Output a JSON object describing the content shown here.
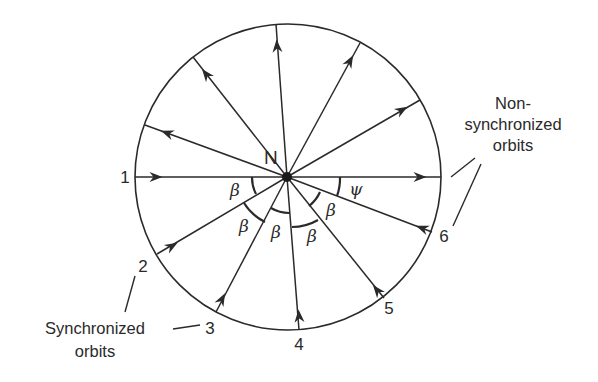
{
  "diagram": {
    "center_label": "N",
    "circle": {
      "cx": 288,
      "cy": 177,
      "r": 153
    },
    "colors": {
      "stroke": "#2a2a2a",
      "text": "#2a2a2a",
      "background": "#ffffff"
    },
    "incoming_orbits": [
      {
        "id": "1",
        "label": "1",
        "start": [
          135,
          177
        ],
        "arrow": [
          156,
          177
        ],
        "label_pos": [
          125,
          183
        ]
      },
      {
        "id": "2",
        "label": "2",
        "start": [
          157,
          254
        ],
        "arrow": [
          172,
          246
        ],
        "label_pos": [
          143,
          272
        ]
      },
      {
        "id": "3",
        "label": "3",
        "start": [
          216,
          312
        ],
        "arrow": [
          222,
          299
        ],
        "label_pos": [
          210,
          334
        ]
      },
      {
        "id": "4",
        "label": "4",
        "start": [
          299,
          330
        ],
        "arrow": [
          299,
          316
        ],
        "label_pos": [
          299,
          350
        ]
      },
      {
        "id": "5",
        "label": "5",
        "start": [
          384,
          298
        ],
        "arrow": [
          377,
          290
        ],
        "label_pos": [
          389,
          314
        ]
      },
      {
        "id": "6",
        "label": "6",
        "start": [
          432,
          232
        ],
        "arrow": [
          422,
          228
        ],
        "label_pos": [
          444,
          242
        ]
      }
    ],
    "outgoing_rays": [
      {
        "end": [
          441,
          177
        ],
        "arrow": [
          420,
          177
        ]
      },
      {
        "end": [
          420,
          100
        ],
        "arrow": [
          402,
          110
        ]
      },
      {
        "end": [
          360,
          43
        ],
        "arrow": [
          350,
          61
        ]
      },
      {
        "end": [
          276,
          24
        ],
        "arrow": [
          277,
          46
        ]
      },
      {
        "end": [
          193,
          57
        ],
        "arrow": [
          206,
          74
        ]
      },
      {
        "end": [
          145,
          125
        ],
        "arrow": [
          167,
          133
        ]
      }
    ],
    "angle_labels": [
      {
        "text": "β",
        "pos": [
          235,
          196
        ],
        "between": [
          "1",
          "2"
        ]
      },
      {
        "text": "β",
        "pos": [
          244,
          232
        ],
        "between": [
          "2",
          "3"
        ]
      },
      {
        "text": "β",
        "pos": [
          276,
          238
        ],
        "between": [
          "3",
          "4"
        ]
      },
      {
        "text": "β",
        "pos": [
          312,
          242
        ],
        "between": [
          "4",
          "5"
        ]
      },
      {
        "text": "β",
        "pos": [
          331,
          216
        ],
        "between": [
          "5",
          "6"
        ]
      },
      {
        "text": "ψ",
        "pos": [
          356,
          195
        ],
        "between": [
          "6",
          "horizontal"
        ]
      }
    ],
    "groups": {
      "synchronized": {
        "line1": "Synchronized",
        "line2": "orbits",
        "members": [
          "1",
          "2",
          "3",
          "4",
          "5"
        ]
      },
      "non_synchronized": {
        "line1": "Non-",
        "line2": "synchronized",
        "line3": "orbits",
        "members": [
          "6"
        ]
      }
    }
  }
}
